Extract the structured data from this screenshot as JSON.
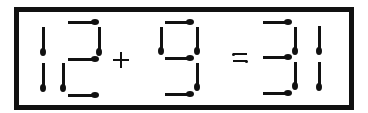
{
  "puzzle": {
    "type": "matchstick-equation",
    "equation_text": "12 + 9 = 31",
    "left_operand": "12",
    "operator": "+",
    "right_operand": "9",
    "equals": "=",
    "result": "31",
    "colors": {
      "match": "#111111",
      "frame": "#111111",
      "background": "#ffffff"
    }
  },
  "matches": [
    {
      "digit": "1a",
      "dir": "v",
      "x": 43,
      "y1": 27,
      "y2": 52,
      "head": "bottom"
    },
    {
      "digit": "1a",
      "dir": "v",
      "x": 43,
      "y1": 63,
      "y2": 88,
      "head": "bottom"
    },
    {
      "digit": "2",
      "dir": "h",
      "y": 22,
      "x1": 68,
      "x2": 95,
      "head": "right"
    },
    {
      "digit": "2",
      "dir": "v",
      "x": 99,
      "y1": 27,
      "y2": 52,
      "head": "bottom"
    },
    {
      "digit": "2",
      "dir": "h",
      "y": 59,
      "x1": 68,
      "x2": 95,
      "head": "right"
    },
    {
      "digit": "2",
      "dir": "v",
      "x": 63,
      "y1": 63,
      "y2": 88,
      "head": "bottom"
    },
    {
      "digit": "2",
      "dir": "h",
      "y": 95,
      "x1": 68,
      "x2": 95,
      "head": "right"
    },
    {
      "digit": "9",
      "dir": "h",
      "y": 22,
      "x1": 165,
      "x2": 190,
      "head": "right"
    },
    {
      "digit": "9",
      "dir": "v",
      "x": 161,
      "y1": 27,
      "y2": 51,
      "head": "bottom"
    },
    {
      "digit": "9",
      "dir": "v",
      "x": 197,
      "y1": 27,
      "y2": 51,
      "head": "bottom"
    },
    {
      "digit": "9",
      "dir": "h",
      "y": 58,
      "x1": 165,
      "x2": 190,
      "head": "right"
    },
    {
      "digit": "9",
      "dir": "v",
      "x": 197,
      "y1": 63,
      "y2": 87,
      "head": "bottom"
    },
    {
      "digit": "9",
      "dir": "h",
      "y": 94,
      "x1": 165,
      "x2": 190,
      "head": "right"
    },
    {
      "digit": "3",
      "dir": "h",
      "y": 22,
      "x1": 263,
      "x2": 288,
      "head": "right"
    },
    {
      "digit": "3",
      "dir": "v",
      "x": 295,
      "y1": 27,
      "y2": 51,
      "head": "bottom"
    },
    {
      "digit": "3",
      "dir": "h",
      "y": 57,
      "x1": 263,
      "x2": 288,
      "head": "right"
    },
    {
      "digit": "3",
      "dir": "v",
      "x": 295,
      "y1": 62,
      "y2": 86,
      "head": "bottom"
    },
    {
      "digit": "3",
      "dir": "h",
      "y": 93,
      "x1": 263,
      "x2": 288,
      "head": "right"
    },
    {
      "digit": "1b",
      "dir": "v",
      "x": 319,
      "y1": 26,
      "y2": 51,
      "head": "bottom"
    },
    {
      "digit": "1b",
      "dir": "v",
      "x": 319,
      "y1": 62,
      "y2": 87,
      "head": "bottom"
    }
  ]
}
